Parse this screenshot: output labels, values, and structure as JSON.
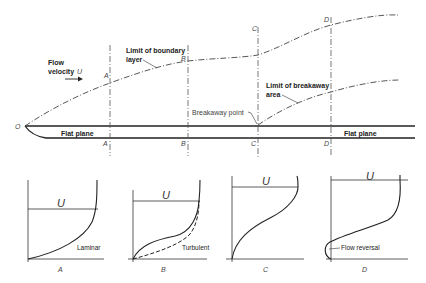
{
  "diagram": {
    "top": {
      "origin_label": "O",
      "flow_velocity_label_line1": "Flow",
      "flow_velocity_label_line2": "velocity",
      "flow_velocity_symbol": "U",
      "boundary_layer_label_line1": "Limit of boundary",
      "boundary_layer_label_line2": "layer",
      "breakaway_area_label_line1": "Limit of breakaway",
      "breakaway_area_label_line2": "area",
      "breakaway_point_label": "Breakaway point",
      "plate_label_left": "Flat plane",
      "plate_label_right": "Flat plane",
      "stations": [
        {
          "top": "A",
          "bottom": "A"
        },
        {
          "top": "B",
          "bottom": "B"
        },
        {
          "top": "C",
          "bottom": "C"
        },
        {
          "top": "D",
          "bottom": "D"
        }
      ]
    },
    "profiles": [
      {
        "id": "A",
        "velocity_symbol": "U",
        "note": "Laminar",
        "caption": "A"
      },
      {
        "id": "B",
        "velocity_symbol": "U",
        "note": "Turbulent",
        "caption": "B"
      },
      {
        "id": "C",
        "velocity_symbol": "U",
        "note": "",
        "caption": "C"
      },
      {
        "id": "D",
        "velocity_symbol": "U",
        "note": "Flow reversal",
        "caption": "D"
      }
    ],
    "colors": {
      "line": "#222222",
      "dash_line": "#555555",
      "background": "#ffffff"
    }
  }
}
